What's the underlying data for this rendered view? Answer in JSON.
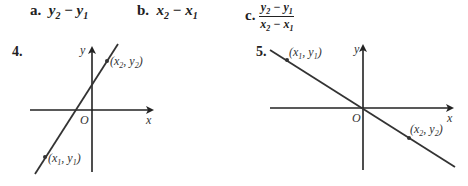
{
  "answer_options": [
    {
      "letter": "a.",
      "expr_parts": [
        "y",
        "2",
        " − ",
        "y",
        "1"
      ],
      "text": "y2 − y1"
    },
    {
      "letter": "b.",
      "expr_parts": [
        "x",
        "2",
        " − ",
        "x",
        "1"
      ],
      "text": "x2 − x1"
    },
    {
      "letter": "c.",
      "numerator": "y2 − y1",
      "denominator": "x2 − x1"
    }
  ],
  "figures": [
    {
      "number": "4.",
      "axis_x_label": "x",
      "axis_y_label": "y",
      "origin_label": "O",
      "point_1_label": "(x1, y1)",
      "point_2_label": "(x2, y2)",
      "slope": "positive"
    },
    {
      "number": "5.",
      "axis_x_label": "x",
      "axis_y_label": "y",
      "origin_label": "O",
      "point_1_label": "(x1, y1)",
      "point_2_label": "(x2, y2)",
      "slope": "negative"
    }
  ],
  "colors": {
    "ink": "#222222",
    "line": "#333333",
    "background": "#ffffff"
  }
}
